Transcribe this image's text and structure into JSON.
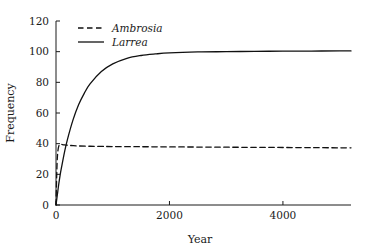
{
  "chart_data": {
    "type": "line",
    "title": "",
    "xlabel": "Year",
    "ylabel": "Frequency",
    "xlim": [
      0,
      5200
    ],
    "ylim": [
      0,
      120
    ],
    "xticks": [
      0,
      2000,
      4000
    ],
    "xticklabels": [
      "0",
      "2000",
      "4000"
    ],
    "yticks": [
      0,
      20,
      40,
      60,
      80,
      100,
      120
    ],
    "yticklabels": [
      "0",
      "20",
      "40",
      "60",
      "80",
      "100",
      "120"
    ],
    "grid": false,
    "legend_position": "upper-left-inside",
    "series": [
      {
        "name": "Ambrosia",
        "style": "dashed",
        "color": "#111111",
        "x": [
          0,
          10,
          20,
          30,
          40,
          50,
          60,
          80,
          100,
          150,
          200,
          300,
          400,
          600,
          800,
          1000,
          1500,
          2000,
          2500,
          3000,
          3500,
          4000,
          4500,
          5000,
          5200
        ],
        "y": [
          0,
          16,
          28,
          34,
          37,
          38.5,
          39.2,
          39.6,
          39.5,
          39.2,
          39.0,
          38.7,
          38.5,
          38.3,
          38.2,
          38.1,
          38.0,
          37.9,
          37.8,
          37.7,
          37.6,
          37.5,
          37.4,
          37.3,
          37.3
        ]
      },
      {
        "name": "Larrea",
        "style": "solid",
        "color": "#111111",
        "x": [
          0,
          25,
          50,
          75,
          100,
          150,
          200,
          300,
          400,
          500,
          600,
          800,
          1000,
          1250,
          1500,
          1750,
          2000,
          2500,
          3000,
          3500,
          4000,
          4500,
          5000,
          5200
        ],
        "y": [
          0,
          7,
          14,
          20,
          25,
          34.5,
          42.5,
          55.5,
          65.5,
          73,
          79,
          87,
          92,
          95.7,
          97.5,
          98.5,
          99.2,
          99.8,
          100.0,
          100.2,
          100.3,
          100.4,
          100.5,
          100.5
        ]
      }
    ],
    "legend": [
      {
        "label": "Ambrosia",
        "style": "dashed"
      },
      {
        "label": "Larrea",
        "style": "solid"
      }
    ]
  }
}
